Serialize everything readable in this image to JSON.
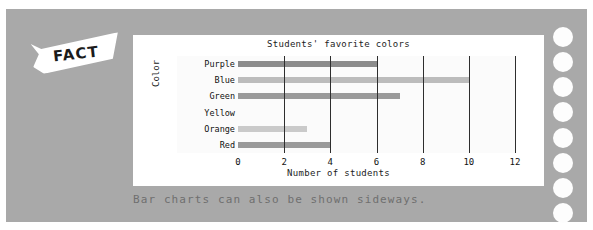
{
  "card": {
    "background_color": "#a9a9a9",
    "fact_badge": {
      "label": "FACT",
      "shape": "ribbon-banner",
      "color": "#ffffff"
    },
    "caption": "Bar charts can also be shown sideways.",
    "caption_color": "#6f6f6f",
    "punch_holes": {
      "count": 8,
      "color": "#fdfdfd"
    }
  },
  "panel": {
    "background_color": "#ffffff"
  },
  "chart_data": {
    "type": "bar",
    "orientation": "horizontal",
    "title": "Students' favorite colors",
    "xlabel": "Number of students",
    "ylabel": "Color",
    "categories": [
      "Purple",
      "Blue",
      "Green",
      "Yellow",
      "Orange",
      "Red"
    ],
    "values": [
      6,
      10,
      7,
      0,
      3,
      4
    ],
    "bar_colors": [
      "#8c8c8c",
      "#bcbcbc",
      "#9a9a9a",
      "#cfcfcf",
      "#cacaca",
      "#9a9a9a"
    ],
    "xlim": [
      0,
      12
    ],
    "xticks": [
      0,
      2,
      4,
      6,
      8,
      10,
      12
    ],
    "xtick_labels": [
      "0",
      "2",
      "4",
      "6",
      "8",
      "10",
      "12"
    ],
    "grid": true,
    "grid_axis": "x",
    "grid_color": "#2e2e2e",
    "legend": false,
    "plot_background": "#fbfbfb"
  }
}
